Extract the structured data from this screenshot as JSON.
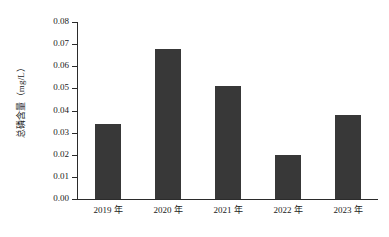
{
  "chart_data": {
    "type": "bar",
    "title": "",
    "subtitle": "",
    "xlabel": "",
    "ylabel": "总磷含量（mg/L）",
    "categories": [
      "2019 年",
      "2020 年",
      "2021 年",
      "2022 年",
      "2023 年"
    ],
    "values": [
      0.034,
      0.068,
      0.051,
      0.02,
      0.038
    ],
    "ylim": [
      0.0,
      0.08
    ],
    "ytick_labels": [
      "0.08",
      "0.07",
      "0.06",
      "0.05",
      "0.04",
      "0.03",
      "0.02",
      "0.01",
      "0.00"
    ],
    "ytick_values": [
      0.08,
      0.07,
      0.06,
      0.05,
      0.04,
      0.03,
      0.02,
      0.01,
      0.0
    ],
    "ytick_step": 0.01,
    "grid": false,
    "legend": "none",
    "bar_color": "#383838",
    "axis_color": "#2b2b2b",
    "background_color": "#ffffff",
    "series": [
      {
        "name": "总磷含量",
        "values": [
          0.034,
          0.068,
          0.051,
          0.02,
          0.038
        ]
      }
    ]
  }
}
